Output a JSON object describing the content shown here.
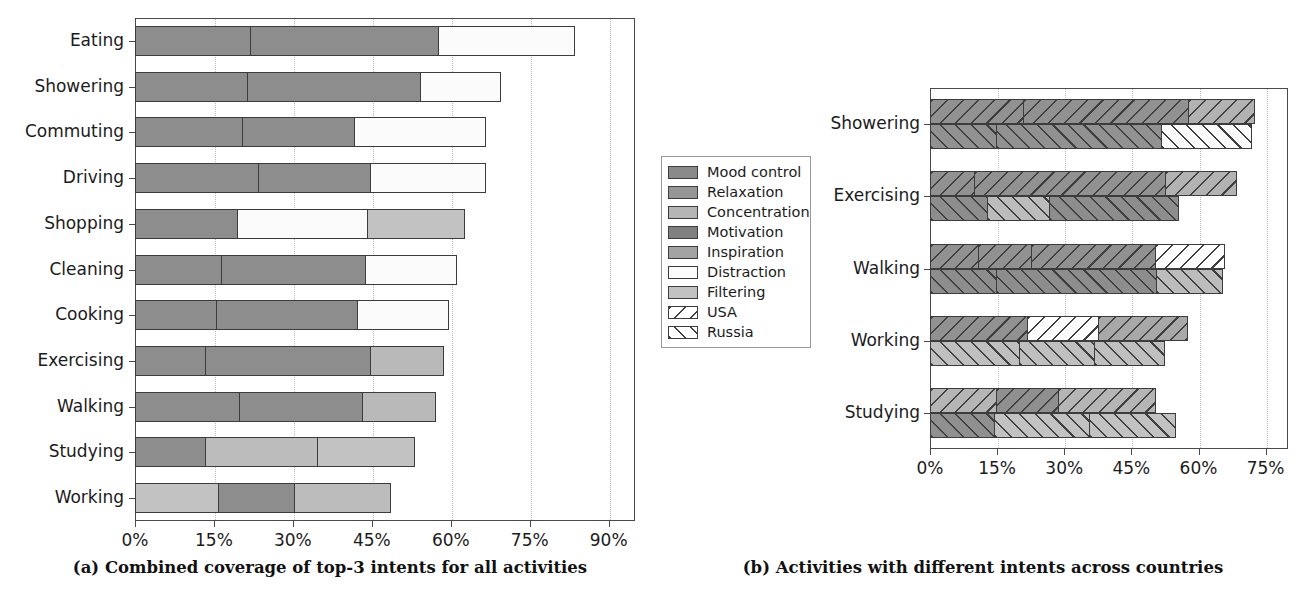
{
  "figure": {
    "caption_a": "(a) Combined coverage of top-3 intents for all activities",
    "caption_b": "(b) Activities with different intents across countries"
  },
  "legend": {
    "items": [
      {
        "label": "Mood control",
        "fill": "#8a8a8a",
        "hatch": "none"
      },
      {
        "label": "Relaxation",
        "fill": "#969696",
        "hatch": "none"
      },
      {
        "label": "Concentration",
        "fill": "#b5b5b5",
        "hatch": "none"
      },
      {
        "label": "Motivation",
        "fill": "#808080",
        "hatch": "none"
      },
      {
        "label": "Inspiration",
        "fill": "#a3a3a3",
        "hatch": "none"
      },
      {
        "label": "Distraction",
        "fill": "#fbfbfb",
        "hatch": "none"
      },
      {
        "label": "Filtering",
        "fill": "#c2c2c2",
        "hatch": "none"
      },
      {
        "label": "USA",
        "fill": "#ffffff",
        "hatch": "backslash"
      },
      {
        "label": "Russia",
        "fill": "#ffffff",
        "hatch": "forwardslash"
      }
    ]
  },
  "chart_data": [
    {
      "id": "panel_a",
      "type": "bar",
      "orientation": "horizontal",
      "stacked": true,
      "title": "",
      "xlabel": "",
      "ylabel": "",
      "xlim": [
        0,
        95
      ],
      "xticks": [
        0,
        15,
        30,
        45,
        60,
        75,
        90
      ],
      "xticklabels": [
        "0%",
        "15%",
        "30%",
        "45%",
        "60%",
        "75%",
        "90%"
      ],
      "grid": "x-dotted",
      "legend_position": "outside-right",
      "categories": [
        "Eating",
        "Showering",
        "Commuting",
        "Driving",
        "Shopping",
        "Cleaning",
        "Cooking",
        "Exercising",
        "Walking",
        "Studying",
        "Working"
      ],
      "totals": [
        84,
        70,
        67,
        67,
        63,
        61.5,
        60,
        59,
        57.5,
        53.5,
        49
      ],
      "rows": [
        {
          "activity": "Eating",
          "total": 84,
          "segments": [
            {
              "intent": "Mood control",
              "value": 22,
              "fill": "#8d8d8d"
            },
            {
              "intent": "Relaxation",
              "value": 36,
              "fill": "#8d8d8d"
            },
            {
              "intent": "Distraction",
              "value": 26,
              "fill": "#fbfbfb"
            }
          ]
        },
        {
          "activity": "Showering",
          "total": 70,
          "segments": [
            {
              "intent": "Mood control",
              "value": 21.5,
              "fill": "#8d8d8d"
            },
            {
              "intent": "Relaxation",
              "value": 33,
              "fill": "#8d8d8d"
            },
            {
              "intent": "Distraction",
              "value": 15.5,
              "fill": "#fbfbfb"
            }
          ]
        },
        {
          "activity": "Commuting",
          "total": 67,
          "segments": [
            {
              "intent": "Mood control",
              "value": 20.5,
              "fill": "#8d8d8d"
            },
            {
              "intent": "Relaxation",
              "value": 21.5,
              "fill": "#8d8d8d"
            },
            {
              "intent": "Distraction",
              "value": 25,
              "fill": "#fbfbfb"
            }
          ]
        },
        {
          "activity": "Driving",
          "total": 67,
          "segments": [
            {
              "intent": "Mood control",
              "value": 23.5,
              "fill": "#8d8d8d"
            },
            {
              "intent": "Relaxation",
              "value": 21.5,
              "fill": "#8d8d8d"
            },
            {
              "intent": "Distraction",
              "value": 22,
              "fill": "#fbfbfb"
            }
          ]
        },
        {
          "activity": "Shopping",
          "total": 63,
          "segments": [
            {
              "intent": "Mood control",
              "value": 19.5,
              "fill": "#8d8d8d"
            },
            {
              "intent": "Distraction",
              "value": 25,
              "fill": "#fbfbfb"
            },
            {
              "intent": "Filtering",
              "value": 18.5,
              "fill": "#c2c2c2"
            }
          ]
        },
        {
          "activity": "Cleaning",
          "total": 61.5,
          "segments": [
            {
              "intent": "Mood control",
              "value": 16.5,
              "fill": "#8d8d8d"
            },
            {
              "intent": "Relaxation",
              "value": 27.5,
              "fill": "#8d8d8d"
            },
            {
              "intent": "Distraction",
              "value": 17.5,
              "fill": "#fbfbfb"
            }
          ]
        },
        {
          "activity": "Cooking",
          "total": 60,
          "segments": [
            {
              "intent": "Mood control",
              "value": 15.5,
              "fill": "#8d8d8d"
            },
            {
              "intent": "Relaxation",
              "value": 27,
              "fill": "#8d8d8d"
            },
            {
              "intent": "Distraction",
              "value": 17.5,
              "fill": "#fbfbfb"
            }
          ]
        },
        {
          "activity": "Exercising",
          "total": 59,
          "segments": [
            {
              "intent": "Mood control",
              "value": 13.5,
              "fill": "#8d8d8d"
            },
            {
              "intent": "Motivation",
              "value": 31.5,
              "fill": "#8d8d8d"
            },
            {
              "intent": "Concentration",
              "value": 14,
              "fill": "#b9b9b9"
            }
          ]
        },
        {
          "activity": "Walking",
          "total": 57.5,
          "segments": [
            {
              "intent": "Mood control",
              "value": 20,
              "fill": "#8d8d8d"
            },
            {
              "intent": "Relaxation",
              "value": 23.5,
              "fill": "#8d8d8d"
            },
            {
              "intent": "Concentration",
              "value": 14,
              "fill": "#b9b9b9"
            }
          ]
        },
        {
          "activity": "Studying",
          "total": 53.5,
          "segments": [
            {
              "intent": "Mood control",
              "value": 13.5,
              "fill": "#8d8d8d"
            },
            {
              "intent": "Concentration",
              "value": 21.5,
              "fill": "#bcbcbc"
            },
            {
              "intent": "Filtering",
              "value": 18.5,
              "fill": "#c2c2c2"
            }
          ]
        },
        {
          "activity": "Working",
          "total": 49,
          "segments": [
            {
              "intent": "Filtering",
              "value": 16,
              "fill": "#c2c2c2"
            },
            {
              "intent": "Mood control",
              "value": 14.5,
              "fill": "#8d8d8d"
            },
            {
              "intent": "Concentration",
              "value": 18.5,
              "fill": "#bcbcbc"
            }
          ]
        }
      ]
    },
    {
      "id": "panel_b",
      "type": "bar",
      "orientation": "horizontal",
      "stacked": true,
      "grouped_by": "country",
      "title": "",
      "xlabel": "",
      "ylabel": "",
      "xlim": [
        0,
        80
      ],
      "xticks": [
        0,
        15,
        30,
        45,
        60,
        75
      ],
      "xticklabels": [
        "0%",
        "15%",
        "30%",
        "45%",
        "60%",
        "75%"
      ],
      "grid": "x-dotted",
      "categories": [
        "Showering",
        "Exercising",
        "Walking",
        "Working",
        "Studying"
      ],
      "series": [
        {
          "name": "USA",
          "hatch": "backslash"
        },
        {
          "name": "Russia",
          "hatch": "forwardslash"
        }
      ],
      "rows": [
        {
          "activity": "Showering",
          "usa": {
            "total": 73,
            "segments": [
              {
                "intent": "Mood control",
                "value": 21,
                "fill": "#919191"
              },
              {
                "intent": "Relaxation",
                "value": 37,
                "fill": "#919191"
              },
              {
                "intent": "Inspiration",
                "value": 15,
                "fill": "#b2b2b2"
              }
            ]
          },
          "russia": {
            "total": 72.5,
            "segments": [
              {
                "intent": "Mood control",
                "value": 15,
                "fill": "#919191"
              },
              {
                "intent": "Relaxation",
                "value": 37,
                "fill": "#919191"
              },
              {
                "intent": "Distraction",
                "value": 20.5,
                "fill": "#fbfbfb"
              }
            ]
          }
        },
        {
          "activity": "Exercising",
          "usa": {
            "total": 69,
            "segments": [
              {
                "intent": "Mood control",
                "value": 10,
                "fill": "#919191"
              },
              {
                "intent": "Motivation",
                "value": 43,
                "fill": "#919191"
              },
              {
                "intent": "Concentration",
                "value": 16,
                "fill": "#b2b2b2"
              }
            ]
          },
          "russia": {
            "total": 56,
            "segments": [
              {
                "intent": "Mood control",
                "value": 13,
                "fill": "#8d8d8d"
              },
              {
                "intent": "Concentration",
                "value": 14,
                "fill": "#bcbcbc"
              },
              {
                "intent": "Motivation",
                "value": 29,
                "fill": "#8d8d8d"
              }
            ]
          }
        },
        {
          "activity": "Walking",
          "usa": {
            "total": 66.5,
            "segments": [
              {
                "intent": "Mood control",
                "value": 11,
                "fill": "#919191"
              },
              {
                "intent": "Relaxation",
                "value": 12,
                "fill": "#919191"
              },
              {
                "intent": "Motivation",
                "value": 28,
                "fill": "#919191"
              },
              {
                "intent": "Distraction",
                "value": 15.5,
                "fill": "#fefefe"
              }
            ]
          },
          "russia": {
            "total": 66,
            "segments": [
              {
                "intent": "Mood control",
                "value": 15,
                "fill": "#8d8d8d"
              },
              {
                "intent": "Relaxation",
                "value": 36,
                "fill": "#8d8d8d"
              },
              {
                "intent": "Concentration",
                "value": 15,
                "fill": "#bcbcbc"
              }
            ]
          }
        },
        {
          "activity": "Working",
          "usa": {
            "total": 58,
            "segments": [
              {
                "intent": "Mood control",
                "value": 22,
                "fill": "#919191"
              },
              {
                "intent": "Distraction",
                "value": 16,
                "fill": "#fefefe"
              },
              {
                "intent": "Concentration",
                "value": 20,
                "fill": "#a8a8a8"
              }
            ]
          },
          "russia": {
            "total": 53,
            "segments": [
              {
                "intent": "Filtering",
                "value": 20,
                "fill": "#bfbfbf"
              },
              {
                "intent": "Concentration",
                "value": 17,
                "fill": "#bfbfbf"
              },
              {
                "intent": "Mood control",
                "value": 16,
                "fill": "#bfbfbf"
              }
            ]
          }
        },
        {
          "activity": "Studying",
          "usa": {
            "total": 51,
            "segments": [
              {
                "intent": "Filtering",
                "value": 15,
                "fill": "#b5b5b5"
              },
              {
                "intent": "Mood control",
                "value": 14,
                "fill": "#8f8f8f"
              },
              {
                "intent": "Concentration",
                "value": 22,
                "fill": "#b5b5b5"
              }
            ]
          },
          "russia": {
            "total": 55.5,
            "segments": [
              {
                "intent": "Mood control",
                "value": 14.5,
                "fill": "#909090"
              },
              {
                "intent": "Concentration",
                "value": 21.5,
                "fill": "#c2c2c2"
              },
              {
                "intent": "Filtering",
                "value": 19.5,
                "fill": "#c2c2c2"
              }
            ]
          }
        }
      ]
    }
  ]
}
